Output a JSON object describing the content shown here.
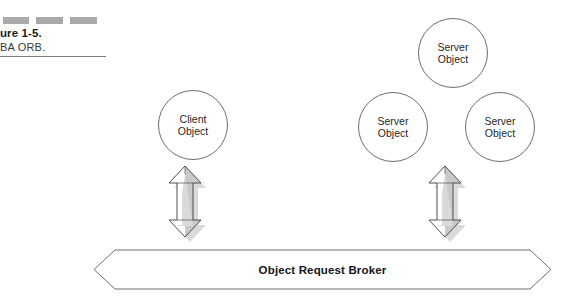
{
  "figure": {
    "caption_title": "ure 1-5.",
    "caption_subtitle": "BA ORB.",
    "decor_bar_color": "#a9a9ac",
    "rule_color": "#7d7d7d"
  },
  "nodes": [
    {
      "id": "client",
      "line1": "Client",
      "line2": "Object"
    },
    {
      "id": "server-top",
      "line1": "Server",
      "line2": "Object"
    },
    {
      "id": "server-mid",
      "line1": "Server",
      "line2": "Object"
    },
    {
      "id": "server-right",
      "line1": "Server",
      "line2": "Object"
    }
  ],
  "connectors": {
    "client_arrow_name": "bidirectional-arrow-client",
    "server_arrow_name": "bidirectional-arrow-server",
    "arrow_fill_light": "#ffffff",
    "arrow_fill_shade": "#c9c9c9",
    "arrow_outline": "#4d4d4d"
  },
  "banner": {
    "label": "Object Request Broker",
    "outline_color": "#6e6e6e",
    "fill_color": "#ffffff"
  }
}
